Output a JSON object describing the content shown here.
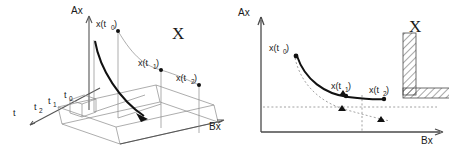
{
  "figure": {
    "title_semantic": "two-panel-diagram-trajectory-and-state-space",
    "background_color": "#ffffff",
    "stroke_color": "#111111",
    "light_stroke_color": "#8a8a8a"
  },
  "left_panel": {
    "name": "3d-time-axis-diagram",
    "axes": {
      "vertical_label": "Ax",
      "depth_label": "t",
      "horizontal_label": "Bx"
    },
    "time_ticks": [
      {
        "label": "t",
        "sub": ""
      },
      {
        "label": "t",
        "sub": "2"
      },
      {
        "label": "t",
        "sub": "1"
      },
      {
        "label": "t",
        "sub": "0"
      }
    ],
    "points": [
      {
        "label": "x(t",
        "sub": "0",
        "close": ")"
      },
      {
        "label": "x(t",
        "sub": "1",
        "close": ")"
      },
      {
        "label": "x(t",
        "sub": "2",
        "close": ")"
      }
    ],
    "region_label": "X"
  },
  "right_panel": {
    "name": "state-space-projection-diagram",
    "axes": {
      "vertical_label": "Ax",
      "horizontal_label": "Bx"
    },
    "points": [
      {
        "label": "x(t",
        "sub": "0",
        "close": ")"
      },
      {
        "label": "x(t",
        "sub": "1",
        "close": ")"
      },
      {
        "label": "x(t",
        "sub": "2",
        "close": ")"
      }
    ],
    "region_label": "X",
    "hatched_region_name": "constraint-set-X"
  }
}
